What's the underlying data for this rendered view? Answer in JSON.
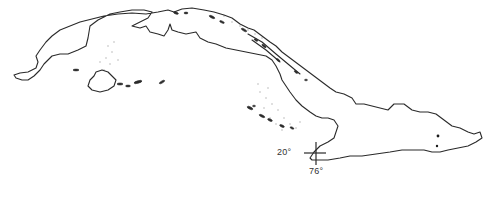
{
  "map": {
    "subject": "Cuba outline map",
    "colors": {
      "coastline": "#2a2a2a",
      "background": "#ffffff",
      "shoal_stipple": "#b8b8b8"
    },
    "reference_marker": {
      "latitude_label": "20°",
      "longitude_label": "76°"
    },
    "features": [
      {
        "name": "main-island",
        "type": "coastline"
      },
      {
        "name": "isla-de-la-juventud",
        "type": "island"
      },
      {
        "name": "southern-cays",
        "type": "island-chain"
      },
      {
        "name": "northern-cays",
        "type": "island-chain"
      },
      {
        "name": "city-point",
        "type": "point"
      }
    ]
  }
}
